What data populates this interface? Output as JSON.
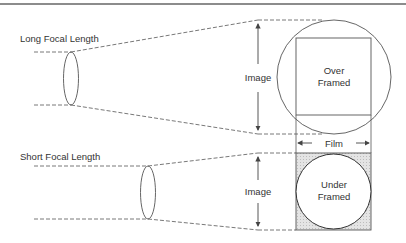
{
  "diagram": {
    "long": {
      "label": "Long Focal Length",
      "image_label": "Image",
      "frame_label_line1": "Over",
      "frame_label_line2": "Framed"
    },
    "short": {
      "label": "Short Focal Length",
      "image_label": "Image",
      "frame_label_line1": "Under",
      "frame_label_line2": "Framed"
    },
    "film_label": "Film",
    "colors": {
      "line": "#555555",
      "hatch": "#d6d6d6",
      "text": "#333333"
    }
  }
}
